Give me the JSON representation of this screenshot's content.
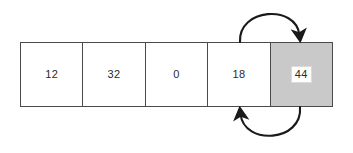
{
  "diagram": {
    "background_color": "#ffffff",
    "array": {
      "name": "array-cells",
      "border_color": "#4a4a4a",
      "shaded_fill": "#c9c9c9",
      "cell_fill": "#ffffff",
      "cells": [
        {
          "value": "12",
          "shaded": false
        },
        {
          "value": "32",
          "shaded": false
        },
        {
          "value": "0",
          "shaded": false
        },
        {
          "value": "18",
          "shaded": false
        },
        {
          "value": "44",
          "shaded": true
        }
      ]
    },
    "arrows": [
      {
        "name": "top-arrow",
        "direction": "left-to-right",
        "color": "#1a1a1a",
        "position": "above"
      },
      {
        "name": "bottom-arrow",
        "direction": "right-to-left",
        "color": "#1a1a1a",
        "position": "below"
      }
    ]
  }
}
